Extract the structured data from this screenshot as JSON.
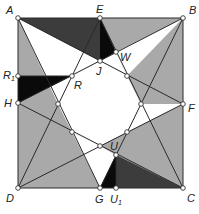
{
  "diagram": {
    "type": "geometric-figure",
    "colors": {
      "light_gray": "#a9a9a9",
      "dark_gray": "#3c3c3c",
      "black": "#0a0a0a",
      "white": "#ffffff",
      "line": "#2a2a2a"
    },
    "points": {
      "A": {
        "label": "A",
        "x": 18,
        "y": 18
      },
      "B": {
        "label": "B",
        "x": 183,
        "y": 18
      },
      "C": {
        "label": "C",
        "x": 183,
        "y": 188
      },
      "D": {
        "label": "D",
        "x": 18,
        "y": 188
      },
      "E": {
        "label": "E",
        "x": 100,
        "y": 18
      },
      "F": {
        "label": "F",
        "x": 183,
        "y": 104
      },
      "G": {
        "label": "G",
        "x": 100,
        "y": 188
      },
      "H": {
        "label": "H",
        "x": 18,
        "y": 103
      },
      "J": {
        "label": "J",
        "x": 100,
        "y": 61
      },
      "W": {
        "label": "W",
        "x": 116,
        "y": 52
      },
      "R": {
        "label": "R",
        "x": 72,
        "y": 76
      },
      "R1": {
        "label": "R",
        "sub": "1",
        "x": 18,
        "y": 76
      },
      "U": {
        "label": "U",
        "x": 116,
        "y": 155
      },
      "U1": {
        "label": "U",
        "sub": "1",
        "x": 116,
        "y": 188
      }
    },
    "octagon_vertices": [
      "J",
      "(127,76)",
      "(141,104)",
      "(127,132)",
      "(100,146)",
      "(72,132)",
      "(58,104)",
      "R"
    ],
    "lines": [
      "A-F",
      "A-G",
      "B-H",
      "B-G",
      "C-E",
      "C-H",
      "D-E",
      "D-F"
    ]
  }
}
